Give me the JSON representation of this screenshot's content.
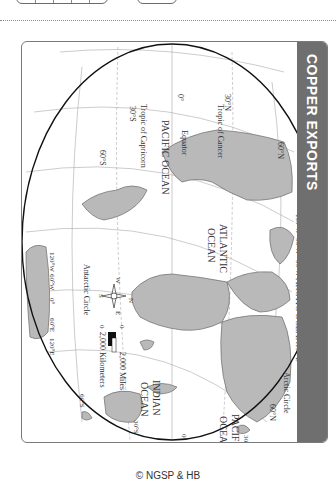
{
  "page": {
    "copyright": "© NGSP & HB"
  },
  "map": {
    "title": "COPPER EXPORTS",
    "orientation": "rotated 90° clockwise",
    "colors": {
      "title_strip": "#6f6f6f",
      "land": "#b9b9b9",
      "land_border": "#6a6a6a",
      "ocean": "#ffffff",
      "graticule": "#a9a9a9",
      "outline": "#111111"
    },
    "oceans": {
      "pacific_west": "PACIFIC OCEAN",
      "atlantic_line1": "ATLANTIC",
      "atlantic_line2": "OCEAN",
      "indian_line1": "INDIAN",
      "indian_line2": "OCEAN",
      "pacific_east_line1": "PACIFIC",
      "pacific_east_line2": "OCEAN",
      "arctic": "ARCTIC OCEAN"
    },
    "lines": {
      "equator": "Equator",
      "tropic_cancer": "Tropic of Cancer",
      "tropic_capricorn": "Tropic of Capricorn",
      "arctic_circle": "Arctic Circle",
      "antarctic_circle": "Antarctic Circle"
    },
    "latitudes": {
      "n30_west": "30°N",
      "s30_west": "30°S",
      "s60_west": "60°S",
      "zero_west": "0°",
      "n60_north": "60°N",
      "n30_east": "30°N",
      "s30_east": "30°S",
      "s60_east": "60°S",
      "zero_east": "0°"
    },
    "longitudes": {
      "w150": "150°W",
      "w90": "90°W",
      "w30": "30°W",
      "e150": "150°E",
      "w120": "120°W",
      "w60": "60°W",
      "zero": "0°",
      "e60": "60°E",
      "e120": "120°E"
    },
    "compass": {
      "n": "N",
      "s": "S",
      "e": "E",
      "w": "W"
    },
    "scale": {
      "zero_top": "0",
      "zero_bottom": "0",
      "miles": "2,000 Miles",
      "kilometers": "2,000 Kilometers"
    }
  }
}
